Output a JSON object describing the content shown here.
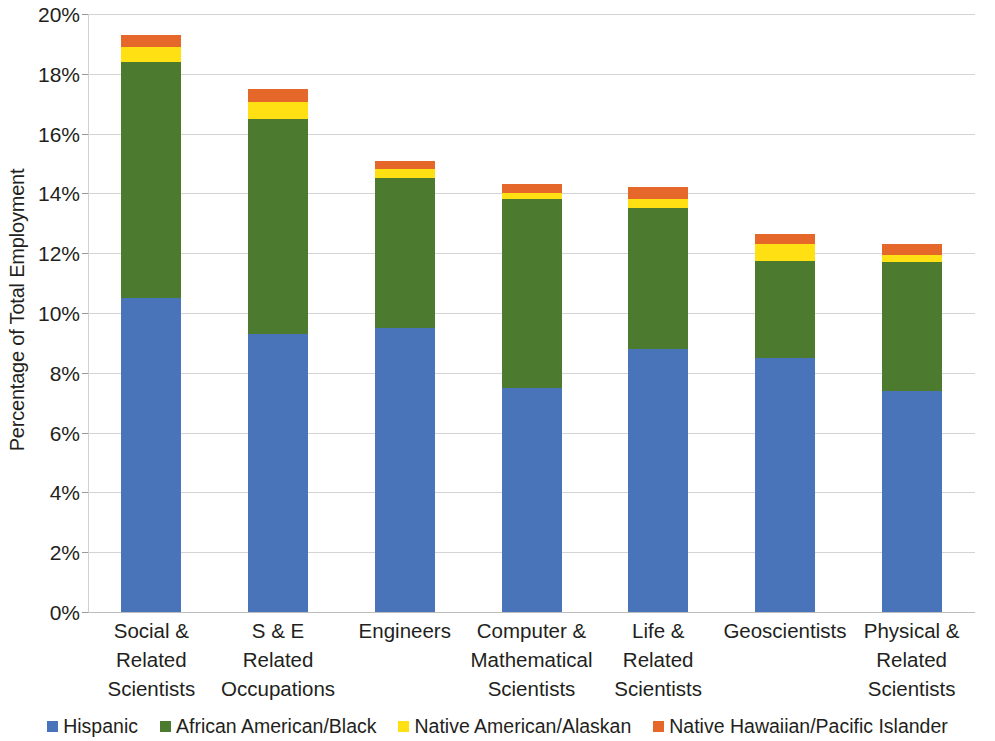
{
  "chart_data": {
    "type": "bar",
    "subtype": "stacked-bar",
    "title": "",
    "xlabel": "",
    "ylabel": "Percentage of Total Employment",
    "ylim": [
      0,
      20
    ],
    "ytick_values": [
      0,
      2,
      4,
      6,
      8,
      10,
      12,
      14,
      16,
      18,
      20
    ],
    "ytick_labels": [
      "0%",
      "2%",
      "4%",
      "6%",
      "8%",
      "10%",
      "12%",
      "14%",
      "16%",
      "18%",
      "20%"
    ],
    "grid": true,
    "legend_position": "bottom",
    "categories": [
      "Social & Related Scientists",
      "S & E Related Occupations",
      "Engineers",
      "Computer & Mathematical Scientists",
      "Life & Related Scientists",
      "Geoscientists",
      "Physical & Related Scientists"
    ],
    "category_lines": [
      [
        "Social &",
        "Related",
        "Scientists"
      ],
      [
        "S & E",
        "Related",
        "Occupations"
      ],
      [
        "Engineers"
      ],
      [
        "Computer &",
        "Mathematical",
        "Scientists"
      ],
      [
        "Life &",
        "Related",
        "Scientists"
      ],
      [
        "Geoscientists"
      ],
      [
        "Physical &",
        "Related",
        "Scientists"
      ]
    ],
    "series": [
      {
        "name": "Hispanic",
        "color": "#4a74ba",
        "values": [
          10.5,
          9.3,
          9.5,
          7.5,
          8.8,
          8.5,
          7.4
        ]
      },
      {
        "name": "African American/Black",
        "color": "#4c7a2f",
        "values": [
          7.9,
          7.2,
          5.0,
          6.3,
          4.7,
          3.25,
          4.3
        ]
      },
      {
        "name": "Native American/Alaskan",
        "color": "#ffe013",
        "values": [
          0.5,
          0.55,
          0.3,
          0.2,
          0.3,
          0.55,
          0.25
        ]
      },
      {
        "name": "Native Hawaiian/Pacific Islander",
        "color": "#e5682a",
        "values": [
          0.4,
          0.45,
          0.3,
          0.3,
          0.4,
          0.35,
          0.35
        ]
      }
    ],
    "totals": [
      19.3,
      17.5,
      15.1,
      14.3,
      14.2,
      12.65,
      12.3
    ]
  },
  "axis": {
    "y_title": "Percentage of Total Employment"
  },
  "legend": {
    "items": [
      {
        "label": "Hispanic",
        "color": "#4a74ba",
        "swatch_name": "legend-swatch-hispanic"
      },
      {
        "label": "African American/Black",
        "color": "#4c7a2f",
        "swatch_name": "legend-swatch-african-american-black"
      },
      {
        "label": "Native American/Alaskan",
        "color": "#ffe013",
        "swatch_name": "legend-swatch-native-american-alaskan"
      },
      {
        "label": "Native Hawaiian/Pacific Islander",
        "color": "#e5682a",
        "swatch_name": "legend-swatch-native-hawaiian-pacific-islander"
      }
    ]
  }
}
